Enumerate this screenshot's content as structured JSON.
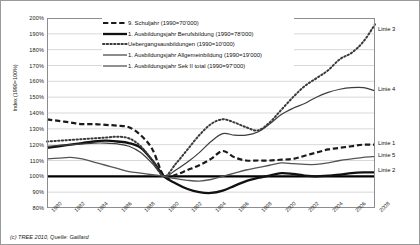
{
  "chart_data": {
    "type": "line",
    "title": "",
    "xlabel": "",
    "ylabel": "Index (1990=100%)",
    "ylim": [
      80,
      200
    ],
    "ytick_step": 10,
    "ytick_labels": [
      "200%",
      "190%",
      "180%",
      "170%",
      "160%",
      "150%",
      "140%",
      "130%",
      "120%",
      "110%",
      "100%",
      "90%",
      "80%"
    ],
    "grid": true,
    "legend_position": "top-center",
    "x": [
      1980,
      1981,
      1982,
      1983,
      1984,
      1985,
      1986,
      1987,
      1988,
      1989,
      1990,
      1991,
      1992,
      1993,
      1994,
      1995,
      1996,
      1997,
      1998,
      1999,
      2000,
      2001,
      2002,
      2003,
      2004,
      2005,
      2006,
      2007,
      2008
    ],
    "xtick_labels": [
      "1980",
      "1982",
      "1984",
      "1986",
      "1988",
      "1990",
      "1992",
      "1994",
      "1996",
      "1998",
      "2000",
      "2002",
      "2004",
      "2006",
      "2008"
    ],
    "series": [
      {
        "name": "9. Schuljahr (1990=70'000)",
        "short_label": "Linie 1",
        "style": "dashed",
        "color": "#1a1a1a",
        "width": 2.2,
        "values": [
          136,
          135,
          134,
          133,
          133,
          132.5,
          132,
          131,
          126,
          117,
          100,
          101,
          104,
          107,
          111,
          116,
          112,
          110,
          110,
          110,
          110.5,
          111,
          113,
          115,
          117,
          118,
          119,
          120,
          120
        ]
      },
      {
        "name": "1. Ausbildungsjahr Berufsbildung (1990=78'000)",
        "short_label": "Linie 2",
        "style": "solid",
        "color": "#111111",
        "width": 2.3,
        "values": [
          118,
          119,
          120,
          121,
          122,
          122.5,
          122,
          121,
          118,
          110,
          100,
          95.5,
          92,
          90,
          89.5,
          91,
          94,
          97,
          99,
          100.5,
          102,
          101.5,
          100.5,
          100,
          100.5,
          101,
          102,
          102.5,
          102.5
        ]
      },
      {
        "name": "Uebergangsausbildungen (1990=10'000)",
        "short_label": "Linie 3",
        "style": "dotted",
        "color": "#3a3a3a",
        "width": 2.0,
        "values": [
          122,
          122.5,
          123,
          123.5,
          124,
          124.5,
          125,
          124,
          119,
          110,
          100,
          108,
          117,
          126,
          133,
          136,
          134,
          131,
          129,
          134,
          142,
          150,
          157,
          162,
          167,
          174,
          178,
          185,
          196
        ]
      },
      {
        "name": "1. Ausbildungsjahr Allgemeinbildung (1990=19'000)",
        "short_label": "Linie 4",
        "style": "solid",
        "color": "#3d3d3d",
        "width": 1.2,
        "values": [
          119,
          119.5,
          120,
          120.5,
          121,
          121,
          120.5,
          119,
          115,
          108,
          100,
          104,
          109,
          115,
          122,
          127,
          126,
          126,
          128,
          133,
          139,
          143,
          146,
          150,
          153,
          155,
          156,
          156,
          154
        ]
      },
      {
        "name": "1. Ausbildungsjahr Sek II total (1990=97'000)",
        "short_label": "Linie 5",
        "style": "solid",
        "color": "#555555",
        "width": 1.3,
        "values": [
          111,
          111.5,
          112,
          111,
          109,
          107,
          105,
          103,
          102,
          101,
          100,
          98.5,
          97.5,
          97,
          98,
          100,
          102,
          104,
          105.5,
          107,
          108.5,
          108,
          107.5,
          107.5,
          108.5,
          110,
          111,
          112,
          112.5
        ]
      }
    ],
    "side_labels": [
      {
        "text": "Linie 3",
        "value": 193
      },
      {
        "text": "Linie 4",
        "value": 155
      },
      {
        "text": "Linie 1",
        "value": 121
      },
      {
        "text": "Linie 5",
        "value": 113
      },
      {
        "text": "Linie 2",
        "value": 104
      }
    ]
  },
  "footer": {
    "credit": "(c) TREE 2010, Quelle: Gaillard"
  }
}
